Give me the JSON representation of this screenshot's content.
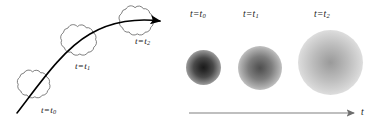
{
  "figure": {
    "background_color": "#ffffff",
    "width": 373,
    "height": 131
  },
  "panel_left": {
    "name": "trajectory-clouds-panel",
    "curve_color": "#000000",
    "cloud_outline_color": "#555555",
    "labels": [
      {
        "id": "t0",
        "variable": "t",
        "equals": "=",
        "subscript": "0",
        "text": "t=t0"
      },
      {
        "id": "t1",
        "variable": "t",
        "equals": "=",
        "subscript": "1",
        "text": "t=t1"
      },
      {
        "id": "t2",
        "variable": "t",
        "equals": "=",
        "subscript": "2",
        "text": "t=t2"
      }
    ],
    "clouds": [
      {
        "id": "cloud-t0",
        "cx": 34,
        "cy": 87,
        "r": 17,
        "lobes": 11
      },
      {
        "id": "cloud-t1",
        "cx": 80,
        "cy": 44,
        "r": 20,
        "lobes": 12
      },
      {
        "id": "cloud-t2",
        "cx": 137,
        "cy": 24,
        "r": 19,
        "lobes": 12
      }
    ]
  },
  "panel_right": {
    "name": "density-blobs-panel",
    "labels": [
      {
        "id": "t0",
        "variable": "t",
        "equals": "=",
        "subscript": "0",
        "text": "t=t0"
      },
      {
        "id": "t1",
        "variable": "t",
        "equals": "=",
        "subscript": "1",
        "text": "t=t1"
      },
      {
        "id": "t2",
        "variable": "t",
        "equals": "=",
        "subscript": "2",
        "text": "t=t2"
      }
    ],
    "blobs": [
      {
        "id": "blob-t0",
        "diameter": 35,
        "center_color": "#1b1b1b",
        "edge_color": "#ffffff"
      },
      {
        "id": "blob-t1",
        "diameter": 44,
        "center_color": "#4f4f4f",
        "edge_color": "#ffffff"
      },
      {
        "id": "blob-t2",
        "diameter": 65,
        "center_color": "#9a9a9a",
        "edge_color": "#ffffff"
      }
    ],
    "axis": {
      "id": "time-axis",
      "label": "t",
      "color": "#808080",
      "direction": "right"
    }
  }
}
